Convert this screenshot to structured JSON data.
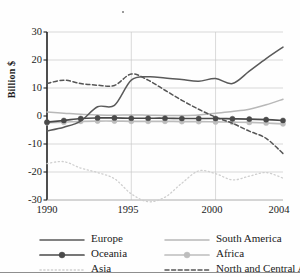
{
  "chart_data": {
    "type": "line",
    "title": "",
    "xlabel": "",
    "ylabel": "Billion $",
    "xlim": [
      1990,
      2004
    ],
    "ylim": [
      -30,
      30
    ],
    "xticks": [
      1990,
      1995,
      2000,
      2004
    ],
    "yticks": [
      30,
      20,
      10,
      0,
      -10,
      -20,
      -30
    ],
    "grid": "horizontal and vertical at ticks",
    "legend_position": "bottom",
    "x": [
      1990,
      1991,
      1992,
      1993,
      1994,
      1995,
      1996,
      1997,
      1998,
      1999,
      2000,
      2001,
      2002,
      2003,
      2004
    ],
    "series": [
      {
        "name": "Europe",
        "style": "solid",
        "color": "#5a5a5a",
        "values": [
          -5.3,
          -4.0,
          -1.8,
          3.3,
          3.8,
          12.8,
          14.0,
          13.6,
          13.0,
          12.4,
          13.4,
          11.6,
          16.0,
          20.5,
          24.6
        ]
      },
      {
        "name": "South America",
        "style": "solid",
        "color": "#b8b8b8",
        "values": [
          1.4,
          1.0,
          0.6,
          0.4,
          0.3,
          0.4,
          0.3,
          0.2,
          0.2,
          0.4,
          1.0,
          1.6,
          2.4,
          4.0,
          6.0
        ]
      },
      {
        "name": "Oceania",
        "style": "solid-marker",
        "color": "#4a4a4a",
        "values": [
          -2.2,
          -1.6,
          -0.9,
          -0.7,
          -0.7,
          -0.8,
          -0.8,
          -0.8,
          -0.9,
          -0.9,
          -0.9,
          -1.0,
          -1.1,
          -1.3,
          -1.6
        ]
      },
      {
        "name": "Africa",
        "style": "solid-marker",
        "color": "#bdbdbd",
        "values": [
          -2.4,
          -2.2,
          -1.9,
          -1.8,
          -1.8,
          -1.9,
          -1.9,
          -1.9,
          -2.0,
          -2.0,
          -2.1,
          -2.2,
          -2.3,
          -2.5,
          -2.8
        ]
      },
      {
        "name": "Asia",
        "style": "dotted",
        "color": "#cfcfcf",
        "values": [
          -17.0,
          -16.3,
          -18.6,
          -20.2,
          -22.4,
          -27.8,
          -30.6,
          -29.0,
          -24.0,
          -19.6,
          -20.6,
          -22.8,
          -21.5,
          -20.2,
          -22.2
        ]
      },
      {
        "name": "North and Central America",
        "style": "dashed",
        "color": "#555555",
        "values": [
          11.6,
          12.8,
          11.6,
          11.0,
          10.9,
          15.0,
          12.8,
          9.2,
          5.6,
          2.4,
          -0.4,
          -2.6,
          -5.4,
          -8.0,
          -13.4
        ]
      }
    ]
  },
  "axes": {
    "ylabel": "Billion $",
    "ytick_labels": [
      "30",
      "20",
      "10",
      "0",
      "-10",
      "-20",
      "-30"
    ],
    "xtick_labels": [
      "1990",
      "1995",
      "2000",
      "2004"
    ]
  },
  "legend": {
    "items": [
      {
        "label": "Europe",
        "style": "solid",
        "color": "#5a5a5a"
      },
      {
        "label": "South America",
        "style": "solid",
        "color": "#b8b8b8"
      },
      {
        "label": "Oceania",
        "style": "solid-marker",
        "color": "#4a4a4a"
      },
      {
        "label": "Africa",
        "style": "solid-marker",
        "color": "#bdbdbd"
      },
      {
        "label": "Asia",
        "style": "dotted",
        "color": "#cfcfcf"
      },
      {
        "label": "North and Central America",
        "style": "dashed",
        "color": "#555555"
      }
    ]
  }
}
